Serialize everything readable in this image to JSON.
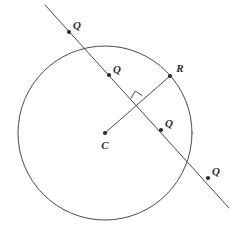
{
  "figure": {
    "type": "geometry-diagram",
    "width": 237,
    "height": 234,
    "background_color": "#ffffff",
    "stroke_color": "#4a4a4a",
    "point_color": "#2b2b2b",
    "label_color": "#2b2b2b"
  },
  "circle": {
    "name": "main-circle",
    "center_x": 105,
    "center_y": 133,
    "radius": 87
  },
  "secant_line": {
    "name": "secant-line",
    "x1": 45,
    "y1": 5,
    "x2": 229,
    "y2": 208
  },
  "radius_segment": {
    "name": "radius-segment-cr",
    "x1": 105,
    "y1": 133,
    "x2": 170,
    "y2": 76
  },
  "right_angle_mark": {
    "name": "right-angle-mark",
    "points": "131.0,98.2 135.3,91.0 142.1,95.6"
  },
  "points": [
    {
      "id": "q-outside-top",
      "label": "Q",
      "x": 69,
      "y": 32,
      "label_x": 77,
      "label_y": 26
    },
    {
      "id": "q-inside-upper",
      "label": "Q",
      "x": 109,
      "y": 75,
      "label_x": 117,
      "label_y": 70
    },
    {
      "id": "r-on-circle",
      "label": "R",
      "x": 170,
      "y": 76,
      "label_x": 180,
      "label_y": 69
    },
    {
      "id": "c-center",
      "label": "C",
      "x": 105,
      "y": 133,
      "label_x": 105,
      "label_y": 146
    },
    {
      "id": "q-inside-lower",
      "label": "Q",
      "x": 161,
      "y": 130,
      "label_x": 169,
      "label_y": 124
    },
    {
      "id": "q-outside-bottom",
      "label": "Q",
      "x": 208,
      "y": 178,
      "label_x": 216,
      "label_y": 172
    }
  ]
}
